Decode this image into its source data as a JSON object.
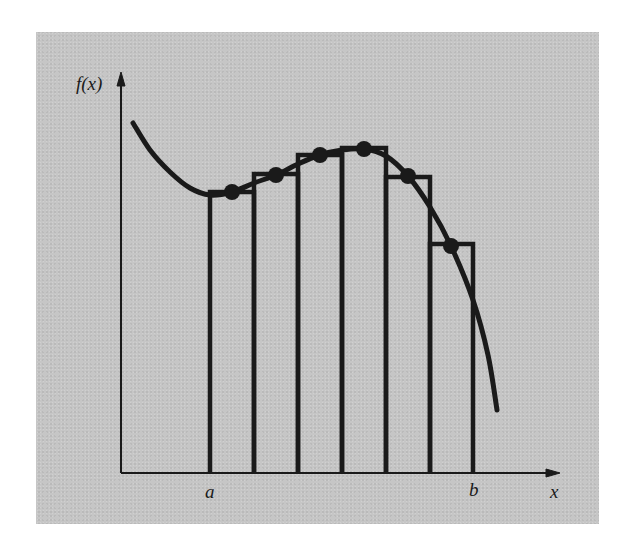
{
  "figure": {
    "type": "midpoint-rule-illustration",
    "y_axis_label": "f(x)",
    "x_axis_label": "x",
    "interval_start_label": "a",
    "interval_end_label": "b",
    "colors": {
      "background": "#c6c6c6",
      "ink": "#1a1a1a",
      "page": "#ffffff"
    },
    "curve_points": [
      [
        133,
        123
      ],
      [
        150,
        150
      ],
      [
        170,
        172
      ],
      [
        190,
        188
      ],
      [
        210,
        195
      ],
      [
        232,
        192
      ],
      [
        254,
        183
      ],
      [
        276,
        175
      ],
      [
        298,
        164
      ],
      [
        320,
        155
      ],
      [
        342,
        150
      ],
      [
        364,
        149
      ],
      [
        386,
        156
      ],
      [
        408,
        176
      ],
      [
        430,
        207
      ],
      [
        451,
        246
      ],
      [
        473,
        300
      ],
      [
        488,
        355
      ],
      [
        497,
        410
      ]
    ],
    "rectangles": [
      {
        "x0": 210,
        "x1": 254,
        "top": 192
      },
      {
        "x0": 254,
        "x1": 298,
        "top": 174
      },
      {
        "x0": 298,
        "x1": 342,
        "top": 155
      },
      {
        "x0": 342,
        "x1": 386,
        "top": 148
      },
      {
        "x0": 386,
        "x1": 430,
        "top": 177
      },
      {
        "x0": 430,
        "x1": 473,
        "top": 244
      }
    ],
    "midpoints": [
      [
        232,
        192
      ],
      [
        276,
        175
      ],
      [
        320,
        155
      ],
      [
        364,
        149
      ],
      [
        408,
        176
      ],
      [
        451,
        246
      ]
    ],
    "n_subintervals": 6
  }
}
